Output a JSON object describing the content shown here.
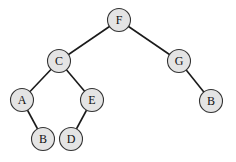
{
  "diagram": {
    "type": "binary-tree",
    "nodes": [
      {
        "id": "n1",
        "label": "F",
        "x": 119,
        "y": 20
      },
      {
        "id": "n2",
        "label": "C",
        "x": 59,
        "y": 61
      },
      {
        "id": "n3",
        "label": "G",
        "x": 179,
        "y": 61
      },
      {
        "id": "n4",
        "label": "A",
        "x": 22,
        "y": 100
      },
      {
        "id": "n5",
        "label": "E",
        "x": 92,
        "y": 100
      },
      {
        "id": "n6",
        "label": "B",
        "x": 211,
        "y": 101
      },
      {
        "id": "n7",
        "label": "B",
        "x": 43,
        "y": 139
      },
      {
        "id": "n8",
        "label": "D",
        "x": 71,
        "y": 139
      }
    ],
    "edges": [
      [
        "n1",
        "n2"
      ],
      [
        "n1",
        "n3"
      ],
      [
        "n2",
        "n4"
      ],
      [
        "n2",
        "n5"
      ],
      [
        "n3",
        "n6"
      ],
      [
        "n4",
        "n7"
      ],
      [
        "n5",
        "n8"
      ]
    ],
    "colors": {
      "node_fill": "#e4e4e4",
      "node_stroke": "#333333",
      "edge": "#1a1a1a"
    }
  }
}
